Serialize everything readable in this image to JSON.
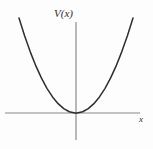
{
  "figure": {
    "name": "potential-energy-parabola",
    "background_color": "#fdfdfd",
    "curve_color": "#2e2e2e",
    "axis_color": "#8a8a8a",
    "labels": {
      "y_axis": "V(x)",
      "x_axis": "x"
    }
  },
  "chart_data": {
    "type": "line",
    "title": "",
    "subtitle": "",
    "xlabel": "x",
    "ylabel": "V(x)",
    "grid": false,
    "legend": null,
    "annotations": [],
    "axes": {
      "x_axis_y_pixel": 113,
      "y_axis_x_pixel": 76,
      "x_axis_start_pixel": 5,
      "x_axis_end_pixel": 140,
      "y_axis_top_pixel": 22,
      "y_axis_bottom_pixel": 140,
      "xlim": [
        -1.15,
        1.15
      ],
      "ylim": [
        -0.25,
        1.2
      ],
      "ticks_shown": false,
      "tick_labels_x": [],
      "tick_labels_y": []
    },
    "series": [
      {
        "name": "V(x) = x^2",
        "equation": "V(x) = x^2",
        "x": [
          -1.02,
          -0.92,
          -0.82,
          -0.72,
          -0.62,
          -0.52,
          -0.42,
          -0.32,
          -0.22,
          -0.12,
          -0.02,
          0.0,
          0.02,
          0.12,
          0.22,
          0.32,
          0.42,
          0.52,
          0.62,
          0.72,
          0.82,
          0.92,
          1.02
        ],
        "values": [
          1.04,
          0.846,
          0.672,
          0.518,
          0.384,
          0.27,
          0.176,
          0.102,
          0.048,
          0.014,
          0.0004,
          0.0,
          0.0004,
          0.014,
          0.048,
          0.102,
          0.176,
          0.27,
          0.384,
          0.518,
          0.672,
          0.846,
          1.04
        ],
        "vertex": [
          0.0,
          0.0
        ],
        "color": "#2e2e2e",
        "linewidth": 1.5
      }
    ]
  }
}
